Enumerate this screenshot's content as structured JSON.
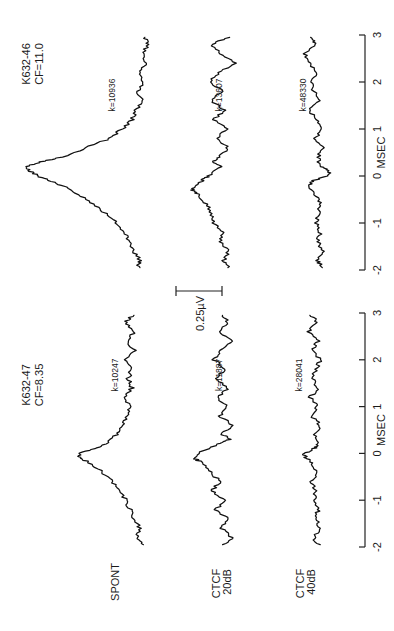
{
  "chart_data": {
    "type": "line",
    "orientation": "rotated-90-ccw",
    "title": "",
    "xlabel": "MSEC",
    "ylabel": "",
    "xlim": [
      -2,
      3
    ],
    "xticks": [
      -2,
      -1,
      0,
      1,
      2,
      3
    ],
    "xtick_labels": [
      "-2",
      "-1",
      "0",
      "1",
      "2",
      "3"
    ],
    "scale_bar": {
      "label": "0.25µV",
      "value_uV": 0.25
    },
    "row_labels": [
      {
        "id": "spont",
        "lines": [
          "SPONT"
        ]
      },
      {
        "id": "ctcf20",
        "lines": [
          "CTCF",
          "20dB"
        ]
      },
      {
        "id": "ctcf40",
        "lines": [
          "CTCF",
          "40dB"
        ]
      }
    ],
    "panels": [
      {
        "id": "k632-46",
        "unit": "K632-46",
        "cf": "CF=11.0",
        "series": [
          {
            "name": "SPONT",
            "k": "k=10936",
            "x": [
              -1.95,
              -1.8,
              -1.6,
              -1.4,
              -1.2,
              -1.0,
              -0.8,
              -0.6,
              -0.4,
              -0.2,
              -0.1,
              0.0,
              0.1,
              0.2,
              0.3,
              0.4,
              0.6,
              0.8,
              1.0,
              1.2,
              1.4,
              1.6,
              1.8,
              2.0,
              2.2,
              2.4,
              2.6,
              2.8,
              2.95
            ],
            "y": [
              0.06,
              0.05,
              0.08,
              0.1,
              0.13,
              0.17,
              0.22,
              0.28,
              0.35,
              0.44,
              0.5,
              0.56,
              0.6,
              0.62,
              0.55,
              0.44,
              0.32,
              0.2,
              0.14,
              0.09,
              0.07,
              0.04,
              0.06,
              0.03,
              0.05,
              0.02,
              0.04,
              0.01,
              0.03
            ]
          },
          {
            "name": "CTCF 20dB",
            "k": "k=13607",
            "x": [
              -1.95,
              -1.8,
              -1.6,
              -1.4,
              -1.2,
              -1.0,
              -0.8,
              -0.6,
              -0.4,
              -0.3,
              -0.2,
              -0.1,
              0.0,
              0.2,
              0.3,
              0.4,
              0.6,
              0.8,
              1.0,
              1.2,
              1.4,
              1.6,
              1.8,
              2.0,
              2.2,
              2.4,
              2.6,
              2.8,
              2.95
            ],
            "y": [
              0.01,
              0.04,
              0.02,
              0.06,
              0.05,
              0.09,
              0.1,
              0.13,
              0.17,
              0.2,
              0.18,
              0.15,
              0.12,
              0.05,
              0.1,
              0.06,
              0.02,
              0.07,
              0.03,
              0.09,
              0.04,
              0.1,
              0.05,
              0.11,
              0.07,
              -0.02,
              0.06,
              0.1,
              0.02
            ]
          },
          {
            "name": "CTCF 40dB",
            "k": "k=48330",
            "x": [
              -1.95,
              -1.8,
              -1.6,
              -1.4,
              -1.2,
              -1.0,
              -0.8,
              -0.6,
              -0.4,
              -0.2,
              -0.1,
              0.0,
              0.1,
              0.2,
              0.4,
              0.6,
              0.8,
              1.0,
              1.2,
              1.4,
              1.6,
              1.8,
              2.0,
              2.2,
              2.4,
              2.6,
              2.8,
              2.95
            ],
            "y": [
              0.0,
              0.02,
              0.0,
              0.02,
              0.01,
              0.03,
              0.02,
              0.01,
              0.03,
              0.07,
              0.04,
              -0.02,
              -0.04,
              0.01,
              0.02,
              0.0,
              0.03,
              0.01,
              0.03,
              0.06,
              0.02,
              0.04,
              0.05,
              0.03,
              0.06,
              0.09,
              0.03,
              0.06
            ]
          }
        ]
      },
      {
        "id": "k632-47",
        "unit": "K632-47",
        "cf": "CF=8.35",
        "series": [
          {
            "name": "SPONT",
            "k": "k=10247",
            "x": [
              -1.95,
              -1.8,
              -1.6,
              -1.4,
              -1.2,
              -1.0,
              -0.8,
              -0.6,
              -0.4,
              -0.2,
              -0.1,
              0.0,
              0.1,
              0.2,
              0.4,
              0.6,
              0.8,
              1.0,
              1.2,
              1.4,
              1.6,
              1.8,
              2.0,
              2.2,
              2.4,
              2.6,
              2.8,
              2.95
            ],
            "y": [
              0.0,
              0.03,
              0.01,
              0.04,
              0.06,
              0.08,
              0.11,
              0.15,
              0.2,
              0.26,
              0.31,
              0.32,
              0.24,
              0.18,
              0.13,
              0.1,
              0.08,
              0.06,
              0.09,
              0.05,
              0.07,
              0.05,
              0.09,
              0.04,
              0.07,
              0.04,
              0.08,
              0.05
            ]
          },
          {
            "name": "CTCF 20dB",
            "k": "k=11887",
            "x": [
              -1.95,
              -1.8,
              -1.6,
              -1.4,
              -1.2,
              -1.0,
              -0.8,
              -0.6,
              -0.4,
              -0.2,
              -0.1,
              0.0,
              0.2,
              0.3,
              0.4,
              0.6,
              0.8,
              1.0,
              1.2,
              1.4,
              1.6,
              1.8,
              2.0,
              2.2,
              2.4,
              2.6,
              2.8,
              2.95
            ],
            "y": [
              0.04,
              0.0,
              0.05,
              0.02,
              0.08,
              0.04,
              0.1,
              0.06,
              0.11,
              0.15,
              0.19,
              0.17,
              0.07,
              0.01,
              0.05,
              0.0,
              0.06,
              0.03,
              0.07,
              0.02,
              0.08,
              0.03,
              0.09,
              0.05,
              0.0,
              0.06,
              0.02,
              0.05
            ]
          },
          {
            "name": "CTCF 40dB",
            "k": "k=28041",
            "x": [
              -1.95,
              -1.8,
              -1.6,
              -1.4,
              -1.2,
              -1.0,
              -0.8,
              -0.6,
              -0.4,
              -0.2,
              -0.1,
              0.0,
              0.1,
              0.2,
              0.4,
              0.6,
              0.8,
              1.0,
              1.2,
              1.4,
              1.6,
              1.8,
              2.0,
              2.2,
              2.4,
              2.6,
              2.8,
              2.95
            ],
            "y": [
              0.02,
              0.04,
              0.01,
              0.03,
              0.02,
              0.04,
              0.03,
              0.06,
              0.02,
              0.05,
              0.08,
              0.09,
              0.04,
              0.02,
              0.04,
              0.01,
              0.05,
              0.02,
              0.06,
              0.02,
              0.05,
              0.03,
              0.01,
              0.05,
              0.02,
              0.07,
              0.03,
              0.05
            ]
          }
        ]
      }
    ]
  }
}
